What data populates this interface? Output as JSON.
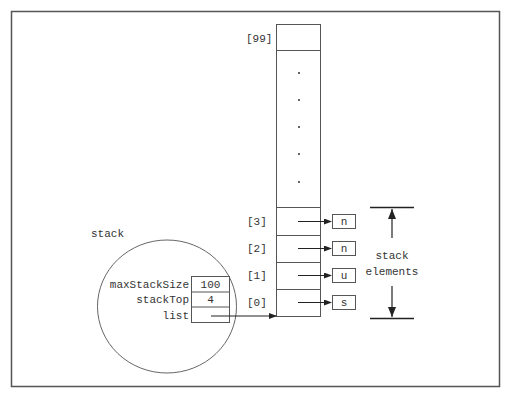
{
  "diagram": {
    "title": "stack",
    "colors": {
      "frame": "#555555",
      "line": "#555555",
      "text": "#333333",
      "arrow": "#222222"
    },
    "struct": {
      "label": "stack",
      "fields": [
        {
          "name": "maxStackSize",
          "value": "100"
        },
        {
          "name": "stackTop",
          "value": "4"
        },
        {
          "name": "list",
          "value": ""
        }
      ]
    },
    "array": {
      "top_index_label": "[99]",
      "ellipsis_dots": [
        ".",
        ".",
        ".",
        ".",
        "."
      ],
      "cells": [
        {
          "index_label": "[3]",
          "element": "n"
        },
        {
          "index_label": "[2]",
          "element": "n"
        },
        {
          "index_label": "[1]",
          "element": "u"
        },
        {
          "index_label": "[0]",
          "element": "s"
        }
      ]
    },
    "bracket": {
      "label_line1": "stack",
      "label_line2": "elements"
    }
  }
}
